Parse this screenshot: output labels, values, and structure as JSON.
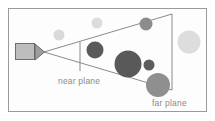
{
  "figure": {
    "background_color": "#ffffff",
    "panel": {
      "border_color": "#9a9a9a",
      "fill_color": "#fdfdfd",
      "x": 8,
      "y": 8,
      "width": 199,
      "height": 104
    },
    "labels": [
      {
        "id": "near-plane-label",
        "text": "near plane",
        "x": 58,
        "y": 84,
        "color": "#8f8f8f"
      },
      {
        "id": "far-plane-label",
        "text": "far plane",
        "x": 152,
        "y": 106,
        "color": "#8f8f8f"
      }
    ],
    "camera": {
      "name": "camera",
      "body": {
        "x": 15,
        "y": 43,
        "width": 20,
        "height": 17,
        "fill": "#bdbdbd",
        "stroke": "#6e6e6e"
      },
      "lens": {
        "points": "35,45 35,60 44,52",
        "fill": "#9e9e9e",
        "stroke": "#5f5f5f"
      },
      "apex": {
        "x": 44,
        "y": 52
      }
    },
    "frustum": {
      "stroke": "#7d7d7d",
      "stroke_width": 0.9,
      "top_line": {
        "x1": 44,
        "y1": 52,
        "x2": 172,
        "y2": 14
      },
      "bottom_line": {
        "x1": 44,
        "y1": 52,
        "x2": 172,
        "y2": 90
      },
      "near_plane_line": {
        "x1": 80,
        "y1": 42,
        "x2": 80,
        "y2": 71
      },
      "far_plane_line": {
        "x1": 172,
        "y1": 14,
        "x2": 172,
        "y2": 90
      }
    },
    "spheres": [
      {
        "id": "sphere-outside-upper-left",
        "cx": 59,
        "cy": 35,
        "r": 5.5,
        "fill": "#d9d9d9",
        "inside_frustum": false
      },
      {
        "id": "sphere-outside-upper-mid",
        "cx": 97,
        "cy": 23,
        "r": 5.5,
        "fill": "#dcdcdc",
        "inside_frustum": false
      },
      {
        "id": "sphere-on-top-plane",
        "cx": 146,
        "cy": 24,
        "r": 6.5,
        "fill": "#8c8c8c",
        "inside_frustum": true
      },
      {
        "id": "sphere-outside-right",
        "cx": 189,
        "cy": 42,
        "r": 11.5,
        "fill": "#dddddd",
        "inside_frustum": false
      },
      {
        "id": "sphere-near-plane-dark",
        "cx": 95,
        "cy": 50,
        "r": 8.5,
        "fill": "#5a5a5a",
        "inside_frustum": true
      },
      {
        "id": "sphere-center-large-dark",
        "cx": 128,
        "cy": 64,
        "r": 13.5,
        "fill": "#595959",
        "inside_frustum": true
      },
      {
        "id": "sphere-small-dark",
        "cx": 149,
        "cy": 65,
        "r": 5.5,
        "fill": "#5d5d5d",
        "inside_frustum": true
      },
      {
        "id": "sphere-far-plane-gray",
        "cx": 158,
        "cy": 85,
        "r": 12.0,
        "fill": "#8f8f8f",
        "inside_frustum": true
      }
    ]
  }
}
